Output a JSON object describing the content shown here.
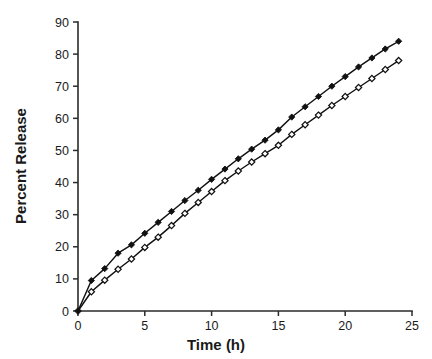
{
  "chart_data": {
    "type": "line",
    "title": "",
    "subtitle": "",
    "xlabel": "Time (h)",
    "ylabel": "Percent Release",
    "xlim": [
      0,
      25
    ],
    "ylim": [
      0,
      90
    ],
    "xticks": [
      0,
      5,
      10,
      15,
      20,
      25
    ],
    "yticks": [
      0,
      10,
      20,
      30,
      40,
      50,
      60,
      70,
      80,
      90
    ],
    "xtick_labels": [
      "0",
      "5",
      "10",
      "15",
      "20",
      "25"
    ],
    "ytick_labels": [
      "0",
      "10",
      "20",
      "30",
      "40",
      "50",
      "60",
      "70",
      "80",
      "90"
    ],
    "grid": false,
    "legend": false,
    "legend_position": "none",
    "annotations": [],
    "x": [
      0,
      1,
      2,
      3,
      4,
      5,
      6,
      7,
      8,
      9,
      10,
      11,
      12,
      13,
      14,
      15,
      16,
      17,
      18,
      19,
      20,
      21,
      22,
      23,
      24
    ],
    "series": [
      {
        "name": "Filled markers",
        "marker": "filled-diamond",
        "values": [
          0,
          9.5,
          13.2,
          18.0,
          20.6,
          24.2,
          27.6,
          31.0,
          34.4,
          37.6,
          41.0,
          44.2,
          47.4,
          50.4,
          53.2,
          56.4,
          60.4,
          63.6,
          66.8,
          70.0,
          73.0,
          76.0,
          78.8,
          81.6,
          84.0
        ]
      },
      {
        "name": "Open markers",
        "marker": "open-diamond",
        "values": [
          0,
          6.0,
          9.6,
          13.0,
          16.2,
          19.8,
          23.0,
          26.6,
          30.4,
          33.8,
          37.2,
          40.6,
          43.6,
          46.4,
          49.0,
          51.6,
          55.0,
          58.0,
          61.0,
          64.0,
          66.8,
          69.6,
          72.4,
          75.2,
          78.0
        ]
      }
    ]
  }
}
